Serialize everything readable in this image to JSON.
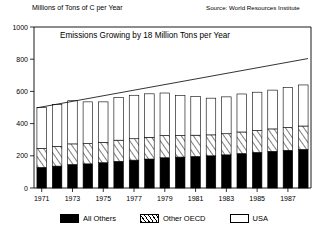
{
  "header": {
    "axis_caption": "Millions of Tons of C per Year",
    "source_note": "Source: World Resources Institute"
  },
  "legend": {
    "items": [
      {
        "label": "All Others",
        "swatch": "solid-black-swatch",
        "color": "#000000"
      },
      {
        "label": "Other OECD",
        "swatch": "diagonal-hatch-swatch",
        "color": "#000000"
      },
      {
        "label": "USA",
        "swatch": "white-outline-swatch",
        "color": "#ffffff"
      }
    ]
  },
  "chart_data": {
    "type": "bar",
    "title": "Emissions Growing by 18 Million Tons per Year",
    "xlabel": "",
    "ylabel": "Millions of Tons of C per Year",
    "ylim": [
      0,
      1000
    ],
    "yticks": [
      0,
      200,
      400,
      600,
      800,
      1000
    ],
    "ytick_labels": [
      "0",
      "200",
      "400",
      "600",
      "800",
      "1000"
    ],
    "grid": false,
    "stacked": true,
    "legend_position": "bottom",
    "categories": [
      "1971",
      "1972",
      "1973",
      "1974",
      "1975",
      "1976",
      "1977",
      "1978",
      "1979",
      "1980",
      "1981",
      "1982",
      "1983",
      "1984",
      "1985",
      "1986",
      "1987",
      "1988"
    ],
    "xtick_labels": [
      "1971",
      "1973",
      "1975",
      "1977",
      "1979",
      "1981",
      "1983",
      "1985",
      "1987"
    ],
    "series": [
      {
        "name": "All Others",
        "values": [
          128,
          136,
          146,
          150,
          157,
          166,
          173,
          180,
          188,
          192,
          196,
          200,
          206,
          214,
          221,
          228,
          234,
          240
        ]
      },
      {
        "name": "Other OECD",
        "values": [
          118,
          122,
          128,
          126,
          126,
          131,
          133,
          135,
          138,
          134,
          132,
          130,
          131,
          134,
          136,
          139,
          142,
          145
        ]
      },
      {
        "name": "USA",
        "values": [
          254,
          261,
          268,
          259,
          252,
          264,
          270,
          270,
          264,
          248,
          240,
          228,
          229,
          236,
          238,
          241,
          247,
          255
        ]
      }
    ],
    "totals": [
      500,
      519,
      542,
      535,
      535,
      561,
      576,
      585,
      590,
      574,
      568,
      558,
      566,
      584,
      595,
      608,
      623,
      640
    ],
    "annotations": [
      {
        "type": "trend-line",
        "label": "Emissions Growing by 18 Million Tons per Year",
        "slope_per_year": 18,
        "y_start": 498,
        "y_end": 804
      }
    ]
  }
}
